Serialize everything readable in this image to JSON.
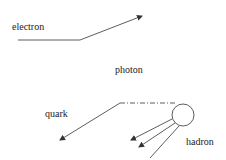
{
  "labels": {
    "electron": "electron",
    "photon": "photon",
    "quark": "quark",
    "hadron": "hadron"
  },
  "colors": {
    "line": "#333333",
    "background": "#ffffff"
  }
}
